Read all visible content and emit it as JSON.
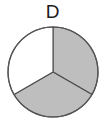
{
  "figure": {
    "label": "D",
    "label_name": "panel-label-d"
  },
  "chart_data": {
    "type": "pie",
    "title": "D",
    "categories": [
      "Slice 1",
      "Slice 2",
      "Slice 3"
    ],
    "values": [
      1,
      1,
      1
    ],
    "fractions": [
      0.3333,
      0.3333,
      0.3333
    ],
    "percentages": [
      "33.3%",
      "33.3%",
      "33.3%"
    ],
    "angles_deg": [
      120,
      120,
      120
    ],
    "shaded_count": 2,
    "unshaded_count": 1,
    "start_angle_deg": 0,
    "direction": "clockwise",
    "slice_fills": [
      "#bebebe",
      "#bebebe",
      "#ffffff"
    ],
    "slice_states": [
      "shaded",
      "shaded",
      "unshaded"
    ],
    "slice_boundaries_deg": [
      0,
      120,
      240
    ],
    "stroke_color": "#4d4d4d",
    "background": "#ffffff",
    "legend": "none",
    "grid": false,
    "xlabel": "",
    "ylabel": "",
    "annotations": []
  },
  "geometry": {
    "center_x": 53,
    "center_y": 72,
    "radius": 45
  }
}
